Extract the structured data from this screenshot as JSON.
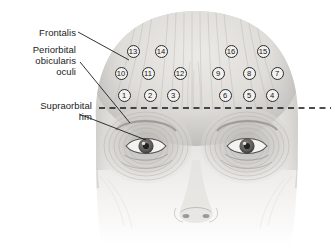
{
  "figure": {
    "background_color": "#ffffff",
    "ink_color": "#1b1b1b"
  },
  "labels": [
    {
      "id": "frontalis",
      "text": "Frontalis",
      "leader_from": [
        78,
        32
      ],
      "leader_to": [
        129,
        60
      ]
    },
    {
      "id": "periorbital",
      "text": "Periorbital\nobicularis\noculi",
      "leader_from": [
        80,
        62
      ],
      "leader_to": [
        130,
        123
      ]
    },
    {
      "id": "supraorbital",
      "text": "Supraorbital\nrim",
      "leader_from": [
        79,
        114
      ],
      "leader_to": [
        146,
        140
      ]
    }
  ],
  "supraorbital_rim_line": {
    "name": "supraorbital-rim-dashed-line",
    "x_start": 99,
    "x_end": 331,
    "y": 108,
    "style": "dashed"
  },
  "markers": [
    {
      "n": "1",
      "x": 124,
      "y": 95
    },
    {
      "n": "2",
      "x": 150,
      "y": 95
    },
    {
      "n": "3",
      "x": 173,
      "y": 95
    },
    {
      "n": "4",
      "x": 272,
      "y": 95
    },
    {
      "n": "5",
      "x": 249,
      "y": 95
    },
    {
      "n": "6",
      "x": 225,
      "y": 95
    },
    {
      "n": "7",
      "x": 277,
      "y": 73
    },
    {
      "n": "8",
      "x": 249,
      "y": 73
    },
    {
      "n": "9",
      "x": 218,
      "y": 73
    },
    {
      "n": "10",
      "x": 121,
      "y": 73
    },
    {
      "n": "11",
      "x": 148,
      "y": 73
    },
    {
      "n": "12",
      "x": 180,
      "y": 73
    },
    {
      "n": "13",
      "x": 133,
      "y": 51
    },
    {
      "n": "14",
      "x": 161,
      "y": 51
    },
    {
      "n": "15",
      "x": 263,
      "y": 51
    },
    {
      "n": "16",
      "x": 231,
      "y": 51
    }
  ],
  "anatomy": {
    "left_eye": {
      "cx": 146,
      "cy": 146
    },
    "right_eye": {
      "cx": 247,
      "cy": 146
    },
    "nose_tip": {
      "cx": 196,
      "cy": 215
    }
  }
}
